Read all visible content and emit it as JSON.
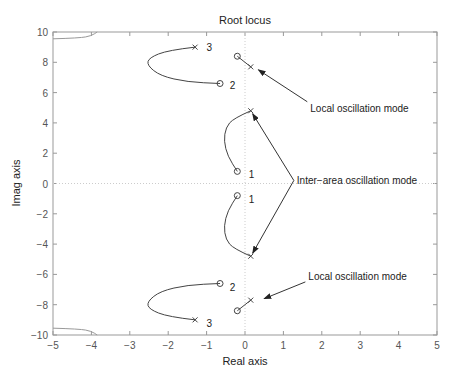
{
  "chart_data": {
    "type": "line",
    "title": "Root locus",
    "xlabel": "Real axis",
    "ylabel": "Imag axis",
    "xlim": [
      -5,
      5
    ],
    "ylim": [
      -10,
      10
    ],
    "xticks": [
      -5,
      -4,
      -3,
      -2,
      -1,
      0,
      1,
      2,
      3,
      4,
      5
    ],
    "yticks": [
      -10,
      -8,
      -6,
      -4,
      -2,
      0,
      2,
      4,
      6,
      8,
      10
    ],
    "grid": false,
    "series": [
      {
        "name": "branch-1-upper",
        "label": "1",
        "pole": [
          0.15,
          4.8
        ],
        "zero": [
          -0.2,
          0.8
        ],
        "path": [
          [
            0.15,
            4.8
          ],
          [
            -0.3,
            4.3
          ],
          [
            -0.5,
            3.7
          ],
          [
            -0.55,
            2.8
          ],
          [
            -0.45,
            1.8
          ],
          [
            -0.2,
            0.8
          ]
        ]
      },
      {
        "name": "branch-1-lower",
        "label": "1",
        "pole": [
          0.15,
          -4.8
        ],
        "zero": [
          -0.2,
          -0.8
        ],
        "path": [
          [
            0.15,
            -4.8
          ],
          [
            -0.3,
            -4.3
          ],
          [
            -0.5,
            -3.7
          ],
          [
            -0.55,
            -2.8
          ],
          [
            -0.45,
            -1.8
          ],
          [
            -0.2,
            -0.8
          ]
        ]
      },
      {
        "name": "branch-2-upper",
        "label": "2",
        "pole": [
          0.15,
          7.7
        ],
        "zero": [
          -0.2,
          8.4
        ],
        "path": [
          [
            0.15,
            7.7
          ],
          [
            -0.2,
            8.4
          ]
        ]
      },
      {
        "name": "branch-2-lower",
        "label": "",
        "pole": [
          0.15,
          -7.7
        ],
        "zero": [
          -0.2,
          -8.4
        ],
        "path": [
          [
            0.15,
            -7.7
          ],
          [
            -0.2,
            -8.4
          ]
        ]
      },
      {
        "name": "branch-3-upper",
        "label": "3",
        "pole": [
          -1.3,
          9.0
        ],
        "zero": [
          -0.65,
          6.6
        ],
        "path": [
          [
            -1.3,
            9.0
          ],
          [
            -2.0,
            8.8
          ],
          [
            -2.5,
            8.3
          ],
          [
            -2.55,
            7.8
          ],
          [
            -2.2,
            7.1
          ],
          [
            -1.5,
            6.7
          ],
          [
            -0.65,
            6.6
          ]
        ]
      },
      {
        "name": "branch-3-lower",
        "label": "3",
        "pole": [
          -1.3,
          -9.0
        ],
        "zero": [
          -0.65,
          -6.6
        ],
        "path": [
          [
            -1.3,
            -9.0
          ],
          [
            -2.0,
            -8.8
          ],
          [
            -2.5,
            -8.3
          ],
          [
            -2.55,
            -7.8
          ],
          [
            -2.2,
            -7.1
          ],
          [
            -1.5,
            -6.7
          ],
          [
            -0.65,
            -6.6
          ]
        ]
      },
      {
        "name": "far-branch-upper",
        "path": [
          [
            -5,
            9.55
          ],
          [
            -4.3,
            9.6
          ],
          [
            -4.0,
            9.75
          ],
          [
            -3.85,
            10
          ]
        ]
      },
      {
        "name": "far-branch-lower",
        "path": [
          [
            -5,
            -9.55
          ],
          [
            -4.3,
            -9.6
          ],
          [
            -4.0,
            -9.75
          ],
          [
            -3.85,
            -10
          ]
        ]
      }
    ],
    "branch_labels": [
      {
        "text": "1",
        "x": 0.1,
        "y": 0.6
      },
      {
        "text": "1",
        "x": 0.1,
        "y": -1.0
      },
      {
        "text": "2",
        "x": -0.4,
        "y": 6.5
      },
      {
        "text": "2",
        "x": -0.4,
        "y": -6.8
      },
      {
        "text": "3",
        "x": -1.0,
        "y": 9.0
      },
      {
        "text": "3",
        "x": -1.0,
        "y": -9.2
      }
    ],
    "annotations": [
      {
        "text": "Local oscillation mode",
        "x": 1.7,
        "y": 5.0,
        "arrow_to": [
          0.35,
          7.5
        ]
      },
      {
        "text": "Inter−area oscillation mode",
        "x": 1.35,
        "y": 0.2,
        "arrow_to": [
          0.2,
          4.6
        ],
        "arrow_to_2": [
          0.2,
          -4.6
        ]
      },
      {
        "text": "Local oscillation mode",
        "x": 1.65,
        "y": -6.1,
        "arrow_to": [
          0.5,
          -7.6
        ]
      }
    ]
  },
  "colors": {
    "axis": "#888888",
    "locus": "#333333",
    "text": "#222222",
    "zero_line": "#cccccc"
  }
}
